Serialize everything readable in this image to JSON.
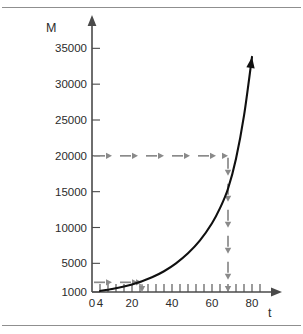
{
  "figure": {
    "name": "exponential-growth-graph",
    "background": "#ffffff",
    "rule_color": "#8f8f8f",
    "curve_color": "#101010",
    "guide_color": "#8a8a8a"
  },
  "chart_data": {
    "type": "line",
    "title": "",
    "xlabel": "t",
    "ylabel": "M",
    "xlim": [
      0,
      88
    ],
    "ylim": [
      1000,
      37000
    ],
    "grid": false,
    "legend": null,
    "x_ticks_labeled": [
      0,
      4,
      20,
      40,
      60,
      80
    ],
    "x_tick_labels": [
      "0",
      "4",
      "20",
      "40",
      "60",
      "80"
    ],
    "x_minor_tick_step": 4,
    "y_ticks_labeled": [
      1000,
      5000,
      10000,
      15000,
      20000,
      25000,
      30000,
      35000
    ],
    "y_tick_labels": [
      "1000",
      "5000",
      "10000",
      "15000",
      "20000",
      "25000",
      "30000",
      "35000"
    ],
    "series": [
      {
        "name": "M(t) exponential growth",
        "x": [
          4,
          10,
          16,
          20,
          25,
          30,
          36,
          42,
          48,
          54,
          60,
          64,
          68,
          72,
          76,
          80
        ],
        "y": [
          1150,
          1420,
          1760,
          2050,
          2500,
          3050,
          3900,
          5000,
          6400,
          8200,
          10600,
          12700,
          15400,
          19600,
          25600,
          33800
        ],
        "arrow_end": true
      }
    ],
    "annotations": [
      {
        "name": "horizontal-guide-upper",
        "kind": "arrow-horizontal-dashed",
        "y_value": 20000,
        "x_from": 0,
        "x_to": 68,
        "label": ""
      },
      {
        "name": "vertical-guide-upper",
        "kind": "arrow-vertical-dashed",
        "x_value": 68,
        "y_from": 20000,
        "y_to": 1000,
        "label": ""
      },
      {
        "name": "horizontal-guide-lower",
        "kind": "arrow-horizontal-dashed",
        "y_value": 2350,
        "x_from": 0,
        "x_to": 25,
        "label": ""
      },
      {
        "name": "vertical-guide-lower",
        "kind": "arrow-vertical-dashed",
        "x_value": 25,
        "y_from": 2350,
        "y_to": 1000,
        "label": ""
      }
    ]
  }
}
